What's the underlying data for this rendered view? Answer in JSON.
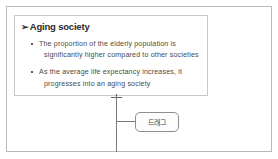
{
  "slide": {
    "content_box": {
      "heading": {
        "marker": "➢",
        "text": "Aging society"
      },
      "bullets": [
        {
          "marker": "square-bullet",
          "lines": [
            "The proportion of the elderly population is",
            "significantly higher compared to other societies"
          ]
        },
        {
          "marker": "square-bullet",
          "lines": [
            "As the average life expectancy increases, it",
            "progresses into an aging society"
          ]
        }
      ]
    },
    "connector": {
      "marker": "cross-marker"
    },
    "callout": {
      "label": "드래그"
    }
  },
  "colors": {
    "background": "#ffffff",
    "frame_border": "#b9b9b9",
    "box_border": "#c8c8c8",
    "connector_line": "#7a7a7a",
    "callout_border": "#8e8e8e",
    "heading_text": "#2b2b2b",
    "body_text": "#4a4a4a"
  }
}
